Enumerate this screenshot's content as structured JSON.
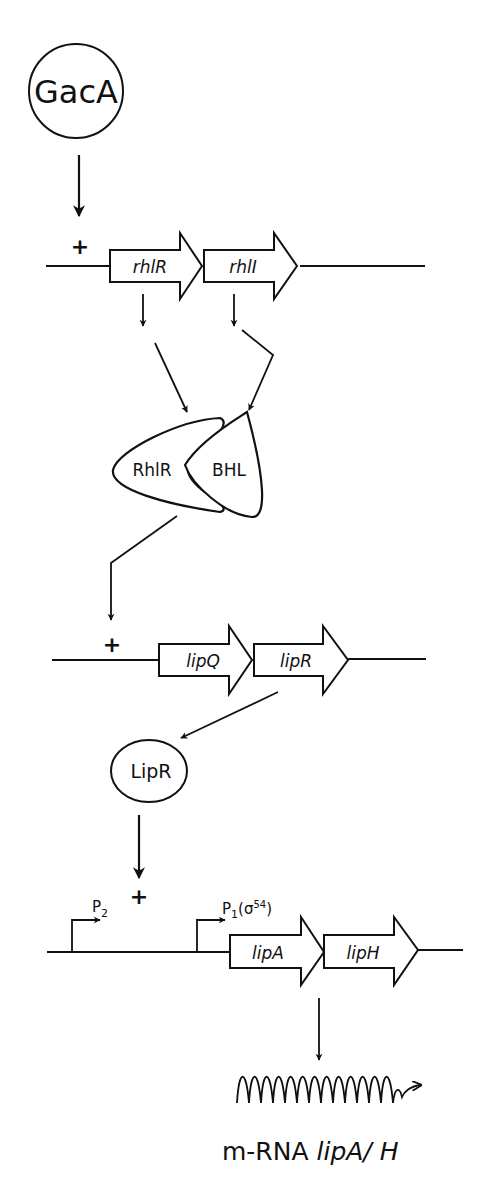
{
  "diagram": {
    "nodes": {
      "gaca": "GacA",
      "rhlr_protein": "RhlR",
      "bhl": "BHL",
      "lipr_protein": "LipR",
      "mrna_prefix": "m-RNA ",
      "mrna_genes": "lipA/ H"
    },
    "operon1": {
      "plus": "+",
      "genes": [
        "rhlR",
        "rhlI"
      ]
    },
    "operon2": {
      "plus": "+",
      "genes": [
        "lipQ",
        "lipR"
      ]
    },
    "operon3": {
      "plus": "+",
      "genes": [
        "lipA",
        "lipH"
      ],
      "promoter_p2": {
        "p": "P",
        "sub": "2"
      },
      "promoter_p1": {
        "p": "P",
        "sub": "1",
        "paren_open": "(σ",
        "sup": "54",
        "paren_close": ")"
      }
    }
  }
}
